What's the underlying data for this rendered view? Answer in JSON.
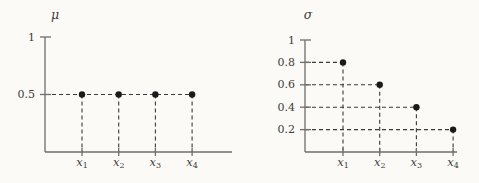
{
  "figure": {
    "background": "#fbfaf7",
    "axis_color": "#6e6e6e",
    "dash_color": "#3a3a3a",
    "point_color": "#1a1a1a",
    "text_color": "#3c3c3c"
  },
  "chart_data": [
    {
      "type": "scatter",
      "title": "μ",
      "categories": [
        {
          "base": "x",
          "sub": "1"
        },
        {
          "base": "x",
          "sub": "2"
        },
        {
          "base": "x",
          "sub": "3"
        },
        {
          "base": "x",
          "sub": "4"
        }
      ],
      "values": [
        0.5,
        0.5,
        0.5,
        0.5
      ],
      "yticks": [
        {
          "value": 1,
          "label": "1"
        },
        {
          "value": 0.5,
          "label": "0.5"
        }
      ],
      "ylim": [
        0,
        1
      ],
      "xlabel": "",
      "ylabel": "μ",
      "grid": "dashed guides from y-axis to each point and from each point down to x-axis",
      "legend": "none"
    },
    {
      "type": "scatter",
      "title": "σ",
      "categories": [
        {
          "base": "x",
          "sub": "1"
        },
        {
          "base": "x",
          "sub": "2"
        },
        {
          "base": "x",
          "sub": "3"
        },
        {
          "base": "x",
          "sub": "4"
        }
      ],
      "values": [
        0.8,
        0.6,
        0.4,
        0.2
      ],
      "yticks": [
        {
          "value": 1,
          "label": "1"
        },
        {
          "value": 0.8,
          "label": "0.8"
        },
        {
          "value": 0.6,
          "label": "0.6"
        },
        {
          "value": 0.4,
          "label": "0.4"
        },
        {
          "value": 0.2,
          "label": "0.2"
        }
      ],
      "ylim": [
        0,
        1
      ],
      "xlabel": "",
      "ylabel": "σ",
      "grid": "dashed guides from y-axis to each point and from each point down to x-axis",
      "legend": "none"
    }
  ]
}
